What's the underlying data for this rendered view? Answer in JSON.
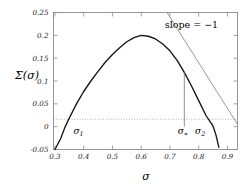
{
  "chart_data": {
    "type": "line",
    "title": "",
    "xlabel": "σ",
    "ylabel": "Σ(σ)",
    "xlim": [
      0.295,
      0.935
    ],
    "ylim": [
      -0.05,
      0.25
    ],
    "grid": false,
    "legend": "none",
    "xticks": [
      "0.3",
      "0.4",
      "0.5",
      "0.6",
      "0.7",
      "0.8",
      "0.9"
    ],
    "xtick_values": [
      0.3,
      0.4,
      0.5,
      0.6,
      0.7,
      0.8,
      0.9
    ],
    "yticks": [
      "0.25",
      "0.2",
      "0.15",
      "0.1",
      "0.05",
      "0",
      "-0.05"
    ],
    "ytick_values": [
      0.25,
      0.2,
      0.15,
      0.1,
      0.05,
      0,
      -0.05
    ],
    "series": [
      {
        "name": "Σ(σ)",
        "style": "solid-black",
        "x": [
          0.3,
          0.31,
          0.32,
          0.335,
          0.35,
          0.375,
          0.4,
          0.425,
          0.45,
          0.475,
          0.5,
          0.525,
          0.55,
          0.575,
          0.6,
          0.625,
          0.65,
          0.675,
          0.7,
          0.725,
          0.75,
          0.775,
          0.8,
          0.825,
          0.85,
          0.86,
          0.87
        ],
        "values": [
          -0.05,
          -0.038,
          -0.026,
          -0.001,
          0.019,
          0.05,
          0.077,
          0.1,
          0.121,
          0.141,
          0.158,
          0.173,
          0.186,
          0.195,
          0.2,
          0.198,
          0.192,
          0.181,
          0.166,
          0.145,
          0.119,
          0.089,
          0.057,
          0.025,
          0.001,
          -0.018,
          -0.045
        ]
      },
      {
        "name": "tangent slope = -1",
        "style": "solid-gray",
        "x": [
          0.69,
          0.935
        ],
        "values": [
          0.25,
          0.005
        ]
      }
    ],
    "annotations": [
      {
        "text": "slope = −1",
        "x": 0.775,
        "y": 0.215
      },
      {
        "text": "σ",
        "sub": "1",
        "x": 0.382,
        "y": -0.016
      },
      {
        "text": "σ",
        "sub": "∗",
        "x": 0.745,
        "y": -0.016
      },
      {
        "text": "σ",
        "sub": "2",
        "x": 0.805,
        "y": -0.016
      }
    ],
    "reference_lines": [
      {
        "name": "zero-line",
        "orientation": "horizontal",
        "value": 0,
        "style": "dotted-gray"
      },
      {
        "name": "sigma-star-vertical",
        "orientation": "vertical",
        "value": 0.75,
        "from": 0.0,
        "to": 0.119,
        "style": "solid-gray"
      }
    ]
  },
  "colors": {
    "curve": "#141414",
    "tangent": "#8e8e8e",
    "frame": "#8c8c8c",
    "zero_line": "#9a9a9a",
    "background": "#ffffff"
  }
}
